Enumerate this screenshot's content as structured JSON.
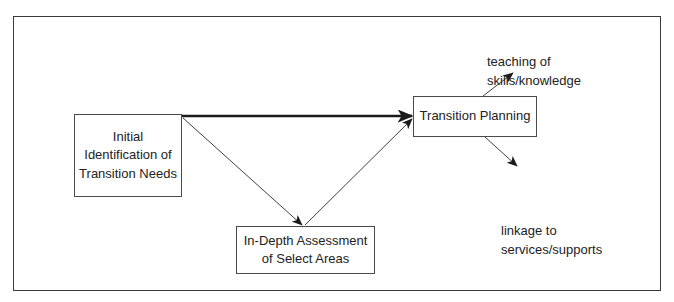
{
  "diagram": {
    "type": "flowchart",
    "nodes": {
      "initial": {
        "lines": [
          "Initial",
          "Identification of",
          "Transition Needs"
        ]
      },
      "planning": {
        "lines": [
          "Transition Planning"
        ]
      },
      "assessment": {
        "lines": [
          "In-Depth Assessment",
          "of Select Areas"
        ]
      }
    },
    "outputs": {
      "teaching": {
        "lines": [
          "teaching of",
          "skills/knowledge"
        ]
      },
      "linkage": {
        "lines": [
          "linkage to",
          "services/supports"
        ]
      }
    },
    "edges": [
      {
        "from": "initial",
        "to": "planning",
        "style": "thick"
      },
      {
        "from": "initial",
        "to": "assessment",
        "style": "thin"
      },
      {
        "from": "assessment",
        "to": "planning",
        "style": "thin"
      },
      {
        "from": "planning",
        "to": "teaching",
        "style": "thin"
      },
      {
        "from": "planning",
        "to": "linkage",
        "style": "thin"
      }
    ],
    "colors": {
      "stroke": "#2a2a2a",
      "text": "#222222",
      "background": "#ffffff"
    }
  }
}
